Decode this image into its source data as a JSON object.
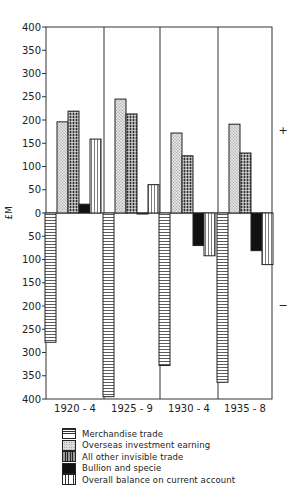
{
  "chart_data": {
    "type": "bar",
    "title": "",
    "xlabel": "",
    "ylabel": "£M",
    "ylim": [
      -400,
      400
    ],
    "yticks": [
      400,
      350,
      300,
      250,
      200,
      150,
      100,
      50,
      0,
      50,
      100,
      150,
      200,
      250,
      300,
      350,
      400
    ],
    "categories": [
      "1920 - 4",
      "1925 - 9",
      "1930 - 4",
      "1935 - 8"
    ],
    "series": [
      {
        "name": "Merchandise trade",
        "pattern": "horizontal-lines",
        "values": [
          -278,
          -395,
          -328,
          -364
        ]
      },
      {
        "name": "Overseas investment earning",
        "pattern": "stipple",
        "values": [
          196,
          245,
          172,
          191
        ]
      },
      {
        "name": "All other invisible trade",
        "pattern": "crosshatch",
        "values": [
          219,
          213,
          123,
          129
        ]
      },
      {
        "name": "Bullion and specie",
        "pattern": "solid-black",
        "values": [
          19,
          -2,
          -70,
          -81
        ]
      },
      {
        "name": "Overall balance on current account",
        "pattern": "vertical-lines",
        "values": [
          159,
          61,
          -92,
          -111
        ]
      }
    ],
    "annotations": {
      "positive_sign": "+",
      "negative_sign": "−"
    },
    "grid": false,
    "legend_position": "bottom"
  },
  "labels": {
    "ylabel": "£M",
    "plus": "+",
    "minus": "−"
  }
}
